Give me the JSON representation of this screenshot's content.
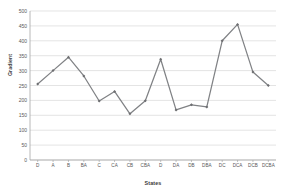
{
  "chart_data": {
    "type": "line",
    "title": "",
    "xlabel": "States",
    "ylabel": "Gradient",
    "categories": [
      "D",
      "A",
      "B",
      "BA",
      "C",
      "CA",
      "CB",
      "CBA",
      "D",
      "DA",
      "DB",
      "DBA",
      "DC",
      "DCA",
      "DCB",
      "DCBA"
    ],
    "values": [
      255,
      300,
      345,
      282,
      198,
      230,
      155,
      199,
      338,
      168,
      185,
      178,
      400,
      455,
      295,
      250
    ],
    "series": [
      {
        "name": "Gradient",
        "values": [
          255,
          300,
          345,
          282,
          198,
          230,
          155,
          199,
          338,
          168,
          185,
          178,
          400,
          455,
          295,
          250
        ]
      }
    ],
    "ylim": [
      0,
      500
    ],
    "y_ticks": [
      0,
      50,
      100,
      150,
      200,
      250,
      300,
      350,
      400,
      450,
      500
    ],
    "y_tick_labels": [
      "0",
      "50",
      "100",
      "150",
      "200",
      "250",
      "300",
      "350",
      "400",
      "450",
      "500"
    ],
    "grid": true,
    "grid_axis": "y",
    "legend": false,
    "legend_position": "none",
    "line_color": "#808285",
    "marker_color": "#6d6e71",
    "marker": "diamond",
    "axis_color": "#a6a6a6",
    "grid_color": "#d9d9d9",
    "background_color": "#ffffff",
    "text_color": "#585858"
  }
}
